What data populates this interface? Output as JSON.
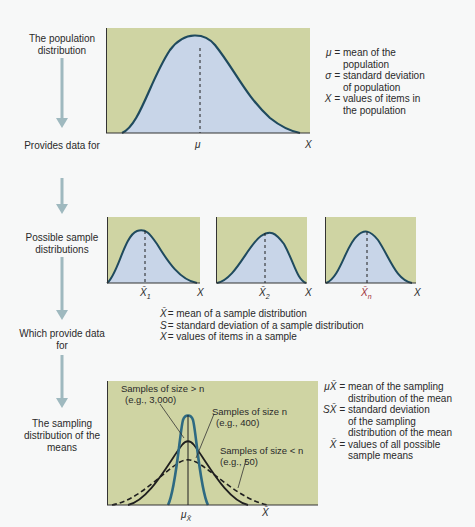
{
  "colors": {
    "panel_bg": "#cfd4a3",
    "fill": "#c8d5e8",
    "curve": "#1f4a5e",
    "arrow": "#9fb9bf",
    "text": "#2a2a2a"
  },
  "stages": [
    {
      "label": "The population distribution"
    },
    {
      "label": "Provides data for"
    },
    {
      "label": "Possible sample distributions"
    },
    {
      "label": "Which provide data for"
    },
    {
      "label": "The sampling distribution of the means"
    }
  ],
  "population": {
    "mu_label": "μ",
    "x_label": "X",
    "legend": [
      {
        "sym": "μ =",
        "text1": "mean of the",
        "text2": "population"
      },
      {
        "sym": "σ =",
        "text1": "standard deviation",
        "text2": "of population"
      },
      {
        "sym": "X =",
        "text1": "values of items in",
        "text2": "the population"
      }
    ]
  },
  "samples": {
    "panels": [
      {
        "mean_label": "X̄",
        "sub": "1",
        "x_label": "X"
      },
      {
        "mean_label": "X̄",
        "sub": "2",
        "x_label": "X"
      },
      {
        "mean_label": "X̄",
        "sub": "n",
        "x_label": "X"
      }
    ],
    "legend": [
      {
        "sym": "X̄",
        "text": "= mean of a sample distribution"
      },
      {
        "sym": "S",
        "text": "= standard deviation of a sample distribution"
      },
      {
        "sym": "X",
        "text": "= values of items in a sample"
      }
    ]
  },
  "sampling": {
    "annotations": [
      {
        "line1": "Samples of size > n",
        "line2": "(e.g., 3,000)"
      },
      {
        "line1": "Samples of size n",
        "line2": "(e.g., 400)"
      },
      {
        "line1": "Samples of size < n",
        "line2": "(e.g., 50)"
      }
    ],
    "mu_label": "μ",
    "mu_sub": "X̄",
    "x_label": "X̄",
    "legend": [
      {
        "sym": "μX̄ =",
        "lines": [
          "mean of the sampling",
          "distribution of the mean"
        ]
      },
      {
        "sym": "SX̄ =",
        "lines": [
          "standard deviation",
          "of the sampling",
          "distribution of the mean"
        ]
      },
      {
        "sym": "X̄ =",
        "lines": [
          "values of all possible",
          "sample means"
        ]
      }
    ]
  }
}
